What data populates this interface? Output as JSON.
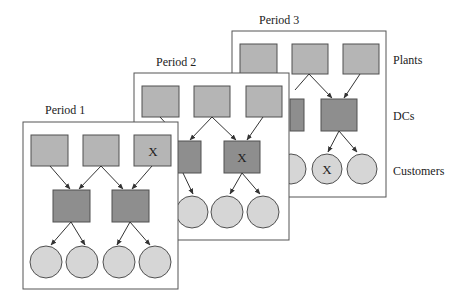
{
  "periods": [
    {
      "label": "Period 1"
    },
    {
      "label": "Period 2"
    },
    {
      "label": "Period 3"
    }
  ],
  "row_labels": {
    "plants": "Plants",
    "dcs": "DCs",
    "customers": "Customers"
  },
  "closed_marker": "X",
  "colors": {
    "plant": "#b5b5b5",
    "dc": "#8e8e8e",
    "customer": "#d6d6d6",
    "stroke": "#505050",
    "panel_border": "#555555"
  }
}
